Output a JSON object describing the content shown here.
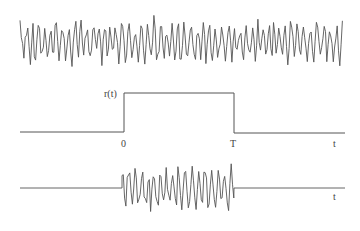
{
  "diagram": {
    "panels": [
      {
        "id": "noise",
        "description": "continuous random noise waveform"
      },
      {
        "id": "window",
        "description": "rectangular window function r(t)",
        "label": "r(t)",
        "tick_start": "0",
        "tick_end": "T",
        "axis_label": "t"
      },
      {
        "id": "windowed",
        "description": "noise multiplied by window (burst between 0 and T)",
        "axis_label": "t"
      }
    ],
    "colors": {
      "line": "#555555",
      "background": "#ffffff"
    }
  },
  "labels": {
    "r": "r(t)",
    "zero": "0",
    "T": "T",
    "t_mid": "t",
    "t_bottom": "t"
  }
}
